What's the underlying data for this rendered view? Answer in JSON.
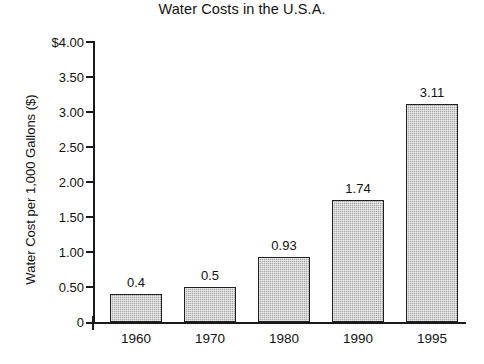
{
  "chart_data": {
    "type": "bar",
    "title": "Water Costs in the U.S.A.",
    "xlabel": "",
    "ylabel": "Water Cost per 1,000 Gallons ($)",
    "categories": [
      "1960",
      "1970",
      "1980",
      "1990",
      "1995"
    ],
    "values": [
      0.4,
      0.5,
      0.93,
      1.74,
      3.11
    ],
    "data_labels": [
      "0.4",
      "0.5",
      "0.93",
      "1.74",
      "3.11"
    ],
    "ylim": [
      0,
      4
    ],
    "ytick_values": [
      0,
      0.5,
      1.0,
      1.5,
      2.0,
      2.5,
      3.0,
      3.5,
      4.0
    ],
    "ytick_labels": [
      "0",
      "0.50",
      "1.00",
      "1.50",
      "2.00",
      "2.50",
      "3.00",
      "3.50",
      "$4.00"
    ],
    "grid": false,
    "legend": null,
    "series": [
      {
        "name": "Water Cost per 1,000 Gallons ($)",
        "values": [
          0.4,
          0.5,
          0.93,
          1.74,
          3.11
        ]
      }
    ],
    "colors": {
      "bar_fill": "#a8a8a8",
      "bar_border": "#1f1f1f",
      "axis": "#1a1a1a",
      "text": "#111111",
      "background": "#ffffff"
    }
  }
}
